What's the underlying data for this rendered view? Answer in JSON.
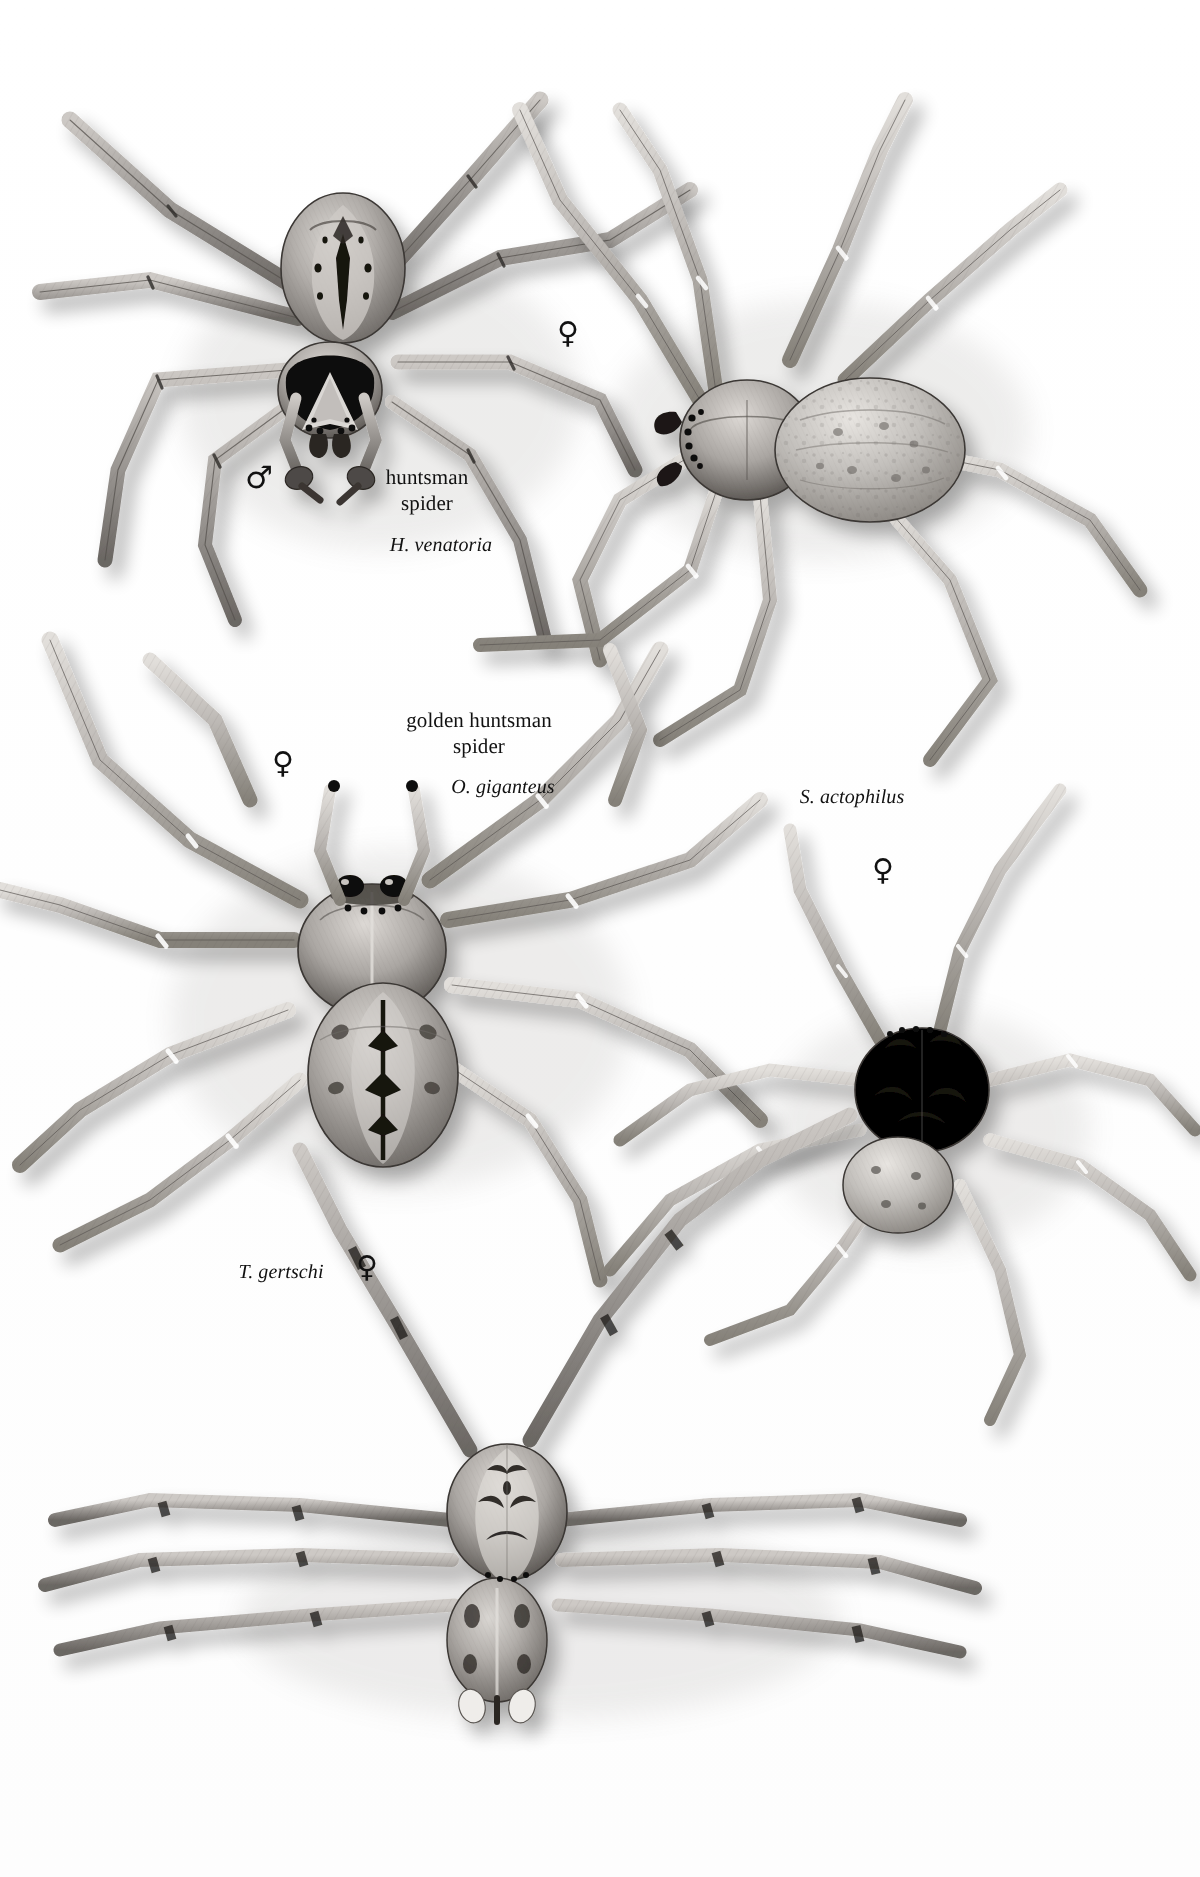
{
  "plate": {
    "title": "Huntsman spiders (Sparassidae) illustration plate",
    "background_color": "#fefefe",
    "ink_color": "#111111",
    "width": 1200,
    "height": 1877
  },
  "specimens": [
    {
      "id": "huntsman-male",
      "common_name_line1": "huntsman",
      "common_name_line2": "spider",
      "scientific_name": "H. venatoria",
      "sex_symbol": "♂",
      "sex": "male",
      "common_label_x": 367,
      "common_label_y": 465,
      "sci_label_x": 381,
      "sci_label_y": 533,
      "sex_x": 245,
      "sex_y": 462
    },
    {
      "id": "huntsman-female",
      "common_name_line1": "",
      "common_name_line2": "",
      "scientific_name": "",
      "sex_symbol": "♀",
      "sex": "female",
      "sex_x": 557,
      "sex_y": 318
    },
    {
      "id": "golden-huntsman-female",
      "common_name_line1": "golden huntsman",
      "common_name_line2": "spider",
      "scientific_name": "O. giganteus",
      "sex_symbol": "♀",
      "sex": "female",
      "common_label_x": 393,
      "common_label_y": 708,
      "sci_label_x": 441,
      "sci_label_y": 775,
      "sex_x": 272,
      "sex_y": 748
    },
    {
      "id": "s-actophilus-female",
      "common_name_line1": "",
      "common_name_line2": "",
      "scientific_name": "S. actophilus",
      "sex_symbol": "♀",
      "sex": "female",
      "sci_label_x": 782,
      "sci_label_y": 785,
      "sex_x": 872,
      "sex_y": 855
    },
    {
      "id": "t-gertschi-female",
      "common_name_line1": "",
      "common_name_line2": "",
      "scientific_name": "T. gertschi",
      "sex_symbol": "♀",
      "sex": "female",
      "sci_label_x": 221,
      "sci_label_y": 1260,
      "sex_x": 356,
      "sex_y": 1252
    }
  ],
  "icons": {
    "male_symbol": "mars-icon",
    "female_symbol": "venus-icon"
  }
}
